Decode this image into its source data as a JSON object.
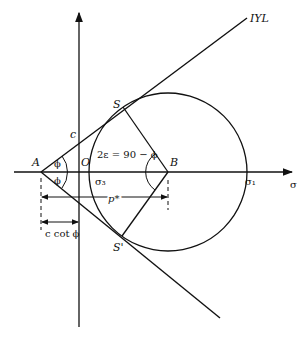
{
  "diagram": {
    "labels": {
      "iyl": "IYL",
      "S": "S",
      "S_prime": "S'",
      "A": "A",
      "O": "O",
      "B": "B",
      "c": "c",
      "phi_upper": "ϕ",
      "phi_lower": "ϕ",
      "angle_eq": "2ε = 90 − ϕ",
      "sigma3": "σ₃",
      "sigma1": "σ₁",
      "sigma_axis": "σ",
      "p_star": "p*",
      "c_cot_phi": "c cot ϕ"
    },
    "colors": {
      "line": "#111111",
      "background": "#ffffff"
    }
  }
}
